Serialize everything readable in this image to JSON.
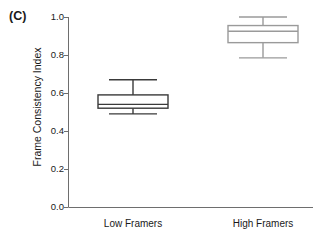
{
  "panel": {
    "label": "(C)"
  },
  "chart_data": {
    "type": "box",
    "title": "",
    "subtitle": "",
    "xlabel": "",
    "ylabel": "Frame Consistency Index",
    "ylim": [
      0.0,
      1.0
    ],
    "yticks": [
      "0.0",
      "0.2",
      "0.4",
      "0.6",
      "0.8",
      "1.0"
    ],
    "ytick_values": [
      0.0,
      0.2,
      0.4,
      0.6,
      0.8,
      1.0
    ],
    "grid": false,
    "legend": "none",
    "categories": [
      "Low Framers",
      "High Framers"
    ],
    "boxes": [
      {
        "name": "Low Framers",
        "whisker_low": 0.49,
        "q1": 0.52,
        "median": 0.54,
        "q3": 0.59,
        "whisker_high": 0.67,
        "color": "#3a3a3a",
        "fill": "#ffffff"
      },
      {
        "name": "High Framers",
        "whisker_low": 0.785,
        "q1": 0.865,
        "median": 0.925,
        "q3": 0.955,
        "whisker_high": 1.0,
        "color": "#9a9a9a",
        "fill": "#ffffff"
      }
    ]
  },
  "axes": {
    "axis_color": "#6e6e6e",
    "tick_labels": [
      "1.0",
      "0.8",
      "0.6",
      "0.4",
      "0.2",
      "0.0"
    ]
  }
}
